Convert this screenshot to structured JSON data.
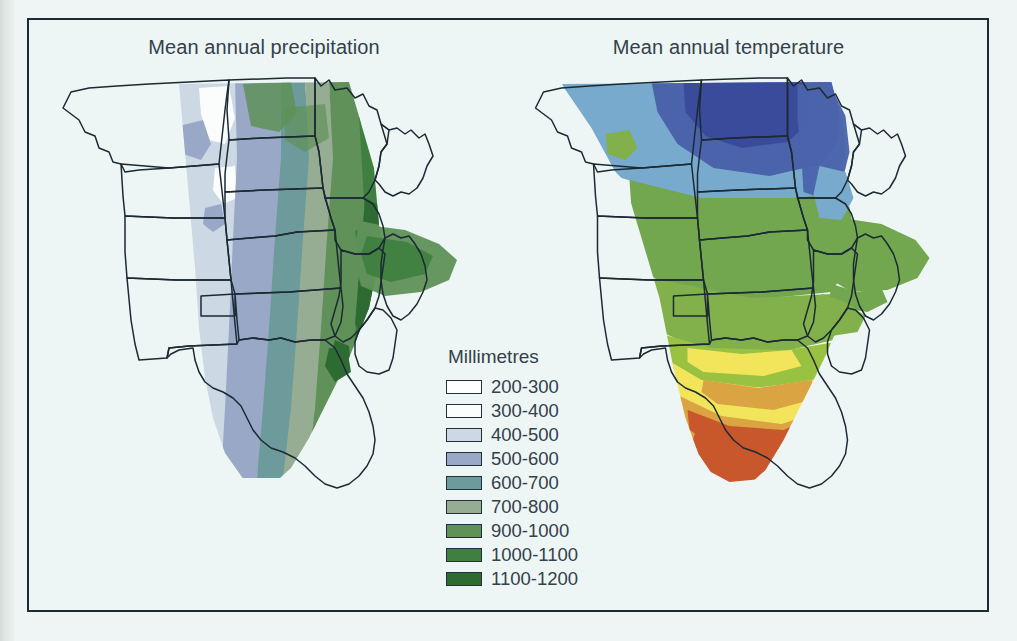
{
  "figure": {
    "background_color": "#edf6f4",
    "frame_color": "#1d2b33",
    "state_outline_color": "#1b2a33"
  },
  "panels": [
    {
      "id": "precipitation",
      "title": "Mean annual precipitation"
    },
    {
      "id": "temperature",
      "title": "Mean annual temperature"
    }
  ],
  "precipitation_legend": {
    "title": "Millimetres",
    "items": [
      {
        "label": "200-300",
        "color": "#ffffff"
      },
      {
        "label": "300-400",
        "color": "#fbfdfd"
      },
      {
        "label": "400-500",
        "color": "#ccd9e4"
      },
      {
        "label": "500-600",
        "color": "#9aa8c8"
      },
      {
        "label": "600-700",
        "color": "#6d9a9a"
      },
      {
        "label": "700-800",
        "color": "#96ad94"
      },
      {
        "label": "900-1000",
        "color": "#5f9158"
      },
      {
        "label": "1000-1100",
        "color": "#3f8040"
      },
      {
        "label": "1100-1200",
        "color": "#2e6b33"
      }
    ]
  },
  "temperature_legend": {
    "title": "Degrees (C)",
    "items": [
      {
        "label": "2-4",
        "color": "#3a4b9c"
      },
      {
        "label": "4-6",
        "color": "#4a63ab"
      },
      {
        "label": "6-8",
        "color": "#78aacd"
      },
      {
        "label": "8-10",
        "color": "#73a74f"
      },
      {
        "label": "10-12",
        "color": "#82b04b"
      },
      {
        "label": "12-14",
        "color": "#99c142"
      },
      {
        "label": "14-16",
        "color": "#f2e martian"
      },
      {
        "label": "16-18",
        "color": "#d9a441"
      },
      {
        "label": "18-20",
        "color": "#c9572c"
      },
      {
        "label": "20-22",
        "color": "#c65a72"
      }
    ]
  },
  "chart_data": {
    "type": "map",
    "maps": [
      {
        "name": "Mean annual precipitation",
        "variable": "mean annual precipitation",
        "unit": "Millimetres",
        "classes": [
          "200-300",
          "300-400",
          "400-500",
          "500-600",
          "600-700",
          "700-800",
          "900-1000",
          "1000-1100",
          "1100-1200"
        ],
        "gradient_direction": "west (dry) to east (wet)",
        "notes": "Values increase eastward from under 400 mm in Montana/Wyoming/Colorado to 1100-1200 mm in Missouri, Illinois and Arkansas."
      },
      {
        "name": "Mean annual temperature",
        "variable": "mean annual temperature",
        "unit": "Degrees (C)",
        "classes": [
          "2-4",
          "4-6",
          "6-8",
          "8-10",
          "10-12",
          "12-14",
          "14-16",
          "16-18",
          "18-20",
          "20-22"
        ],
        "gradient_direction": "north (cold) to south (warm)",
        "notes": "Values increase southward from 2-4 C in North Dakota and Minnesota to 18-20 C in the Texas panhandle region."
      }
    ]
  }
}
